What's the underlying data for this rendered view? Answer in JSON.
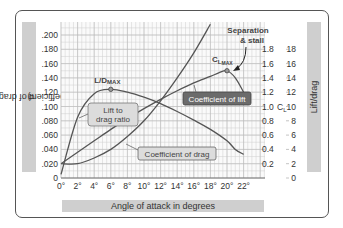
{
  "chart_data": {
    "type": "line",
    "title": "",
    "xlabel": "Angle of attack in degrees",
    "ylabel_left": "Coefficient of drag (CD)",
    "ylabel_right": "Lift/drag",
    "ylabel_right_inner": "CL",
    "x_ticks": [
      "0°",
      "2°",
      "4°",
      "6°",
      "8°",
      "10°",
      "12°",
      "14°",
      "16°",
      "18°",
      "20°",
      "22°"
    ],
    "y_left_ticks": [
      "0",
      ".020",
      ".040",
      ".060",
      ".080",
      ".100",
      ".120",
      ".140",
      ".160",
      ".180",
      ".200"
    ],
    "y_cl_ticks": [
      "0.2",
      "0.4",
      "0.6",
      "0.8",
      "1.0",
      "1.2",
      "1.4",
      "1.6",
      "1.8"
    ],
    "y_ld_ticks": [
      "0",
      "2",
      "4",
      "6",
      "8",
      "10",
      "12",
      "14",
      "16",
      "18"
    ],
    "xlim": [
      0,
      22
    ],
    "ylim_left": [
      0,
      0.2
    ],
    "ylim_cl": [
      0,
      1.8
    ],
    "ylim_ld": [
      0,
      18
    ],
    "grid": true,
    "series": [
      {
        "name": "Coefficient of lift",
        "axis": "CL",
        "x": [
          0,
          2,
          4,
          6,
          8,
          10,
          12,
          14,
          16,
          18,
          19,
          20,
          21,
          22
        ],
        "values": [
          0.2,
          0.36,
          0.52,
          0.68,
          0.83,
          0.97,
          1.1,
          1.22,
          1.33,
          1.42,
          1.47,
          1.5,
          1.4,
          1.2
        ]
      },
      {
        "name": "Lift to drag ratio",
        "axis": "L/D",
        "x": [
          0,
          2,
          4,
          6,
          8,
          10,
          12,
          14,
          16,
          18,
          20,
          21,
          22
        ],
        "values": [
          0.5,
          8.5,
          11.8,
          12.4,
          12.0,
          11.3,
          10.4,
          9.3,
          8.1,
          6.8,
          5.2,
          4.0,
          3.3
        ]
      },
      {
        "name": "Coefficient of drag",
        "axis": "CD",
        "x": [
          0,
          2,
          4,
          6,
          8,
          10,
          12,
          14,
          16,
          18
        ],
        "values": [
          0.02,
          0.02,
          0.028,
          0.04,
          0.058,
          0.08,
          0.108,
          0.14,
          0.175,
          0.215
        ]
      }
    ],
    "annotations": [
      {
        "text": "L/DMAX",
        "x": 6,
        "series": "Lift to drag ratio"
      },
      {
        "text": "CLMAX",
        "x": 20,
        "series": "Coefficient of lift"
      },
      {
        "text": "Separation & stall",
        "x": 21
      },
      {
        "text": "Lift to drag ratio",
        "type": "callout"
      },
      {
        "text": "Coefficient of lift",
        "type": "callout"
      },
      {
        "text": "Coefficient of drag",
        "type": "callout"
      }
    ]
  },
  "labels": {
    "y_left": "Coefficient of drag (C",
    "y_left_sub": "D",
    "y_left_end": ")",
    "y_right": "Lift/drag",
    "x_axis": "Angle of attack in degrees",
    "ld_max_main": "L/D",
    "ld_max_sub": "MAX",
    "cl_max_main": "C",
    "cl_max_sub1": "L",
    "cl_max_sub2": "MAX",
    "separation_line1": "Separation",
    "separation_line2": "& stall",
    "callout_ld_line1": "Lift to",
    "callout_ld_line2": "drag ratio",
    "callout_cl": "Coefficient of lift",
    "callout_cd": "Coefficient of drag",
    "cl_axis_mark": "C",
    "cl_axis_mark_sub": "L"
  },
  "colors": {
    "curve": "#555555",
    "grid": "#cfcfcf",
    "grid_major": "#b8b8b8",
    "label_band": "#cfcfcf",
    "callout_dark_bg": "#6b6b6b",
    "callout_light_bg": "#dcdcdc"
  }
}
